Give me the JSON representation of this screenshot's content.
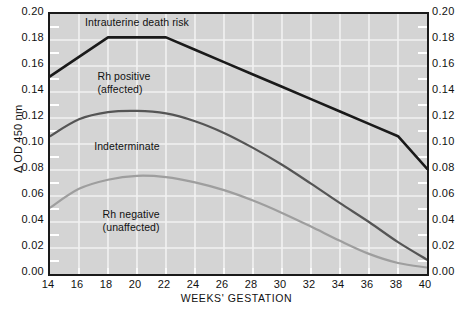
{
  "chart_data": {
    "type": "line",
    "title": "",
    "xlabel": "WEEKS' GESTATION",
    "ylabel": "Δ OD 450 nm",
    "xlim": [
      14,
      40
    ],
    "ylim": [
      0.0,
      0.2
    ],
    "grid": true,
    "legend_position": "none",
    "xticks": [
      14,
      16,
      18,
      20,
      22,
      24,
      26,
      28,
      30,
      32,
      34,
      36,
      38,
      40
    ],
    "xtick_labels": [
      "14",
      "16",
      "18",
      "20",
      "22",
      "24",
      "26",
      "28",
      "30",
      "32",
      "34",
      "36",
      "38",
      "40"
    ],
    "yticks": [
      0.0,
      0.02,
      0.04,
      0.06,
      0.08,
      0.1,
      0.12,
      0.14,
      0.16,
      0.18,
      0.2
    ],
    "ytick_labels": [
      "0.00",
      "0.02",
      "0.04",
      "0.06",
      "0.08",
      "0.10",
      "0.12",
      "0.14",
      "0.16",
      "0.18",
      "0.20"
    ],
    "yminor_step": 0.01,
    "x": [
      14,
      16,
      18,
      20,
      22,
      24,
      26,
      28,
      30,
      32,
      34,
      36,
      38,
      40
    ],
    "series": [
      {
        "name": "Upper zone boundary (intrauterine death risk)",
        "color": "#1a1a1a",
        "width": 2.6,
        "values": [
          0.152,
          0.167,
          0.182,
          0.182,
          0.182,
          0.1725,
          0.163,
          0.1535,
          0.144,
          0.1345,
          0.125,
          0.1155,
          0.106,
          0.081
        ]
      },
      {
        "name": "Middle zone boundary (Rh positive / indeterminate)",
        "color": "#555555",
        "width": 2.2,
        "values": [
          0.106,
          0.119,
          0.1245,
          0.1255,
          0.1235,
          0.1175,
          0.1085,
          0.097,
          0.084,
          0.0695,
          0.0545,
          0.04,
          0.0245,
          0.011
        ]
      },
      {
        "name": "Lower zone boundary (indeterminate / Rh negative)",
        "color": "#9e9e9e",
        "width": 2.2,
        "values": [
          0.051,
          0.0655,
          0.0725,
          0.0755,
          0.0745,
          0.0705,
          0.0645,
          0.0565,
          0.047,
          0.0365,
          0.0255,
          0.0155,
          0.0085,
          0.005
        ]
      }
    ],
    "annotations": [
      {
        "name": "intrauterine-death-risk",
        "lines": [
          "Intrauterine death risk"
        ],
        "x": 20.0,
        "y": 0.1935
      },
      {
        "name": "rh-positive-affected",
        "lines": [
          "Rh positive",
          "(affected)"
        ],
        "x": 19.1,
        "y": 0.1525
      },
      {
        "name": "indeterminate",
        "lines": [
          "Indeterminate"
        ],
        "x": 19.3,
        "y": 0.0985
      },
      {
        "name": "rh-negative-unaffected",
        "lines": [
          "Rh negative",
          "(unaffected)"
        ],
        "x": 19.6,
        "y": 0.0465
      }
    ]
  },
  "colors": {
    "plot_background": "#d4d4d4",
    "grid_line": "#f2f2f2",
    "axis": "#1a1a1a",
    "page_background": "#ffffff",
    "text": "#111111"
  }
}
